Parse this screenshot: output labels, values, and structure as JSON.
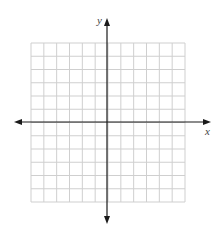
{
  "diagram": {
    "type": "coordinate-grid",
    "grid": {
      "columns": 12,
      "rows": 12,
      "left": 31,
      "top": 43,
      "right": 185,
      "bottom": 202,
      "line_color": "#cfcfcf"
    },
    "axes": {
      "color": "#1a1a1a",
      "origin_x": 107,
      "origin_y": 122,
      "x_axis": {
        "from": 14,
        "to": 211,
        "label": "x"
      },
      "y_axis": {
        "from": 18,
        "to": 224,
        "label": "y"
      }
    }
  }
}
